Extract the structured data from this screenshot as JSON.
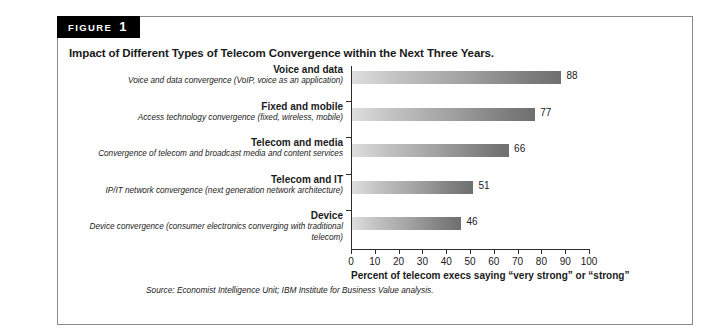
{
  "figure": {
    "badge_word": "FIGURE",
    "badge_number": "1",
    "title": "Impact of Different Types of Telecom Convergence within the Next Three Years.",
    "source": "Source: Economist Intelligence Unit; IBM Institute for Business Value analysis."
  },
  "chart_data": {
    "type": "bar",
    "orientation": "horizontal",
    "title": "Impact of Different Types of Telecom Convergence within the Next Three Years.",
    "xlabel": "Percent of telecom execs saying “very strong” or “strong”",
    "ylabel": "",
    "xlim": [
      0,
      100
    ],
    "xticks": [
      0,
      10,
      20,
      30,
      40,
      50,
      60,
      70,
      80,
      90,
      100
    ],
    "xtick_labels": [
      "0",
      "10",
      "20",
      "30",
      "40",
      "50",
      "60",
      "70",
      "80",
      "90",
      "100"
    ],
    "grid": false,
    "legend": false,
    "categories": [
      "Voice and data",
      "Fixed and mobile",
      "Telecom and media",
      "Telecom and IT",
      "Device"
    ],
    "category_descriptions": [
      "Voice and data convergence (VoIP, voice as an application)",
      "Access technology convergence (fixed, wireless, mobile)",
      "Convergence of telecom and broadcast media and content services",
      "IP/IT network convergence (next generation network architecture)",
      "Device convergence (consumer electronics converging with traditional telecom)"
    ],
    "values": [
      88,
      77,
      66,
      51,
      46
    ],
    "value_labels": [
      "88",
      "77",
      "66",
      "51",
      "46"
    ],
    "bar_gradient": {
      "start": "#dedede",
      "end": "#6f6f6f"
    },
    "axis_color": "#2b2b2b"
  }
}
